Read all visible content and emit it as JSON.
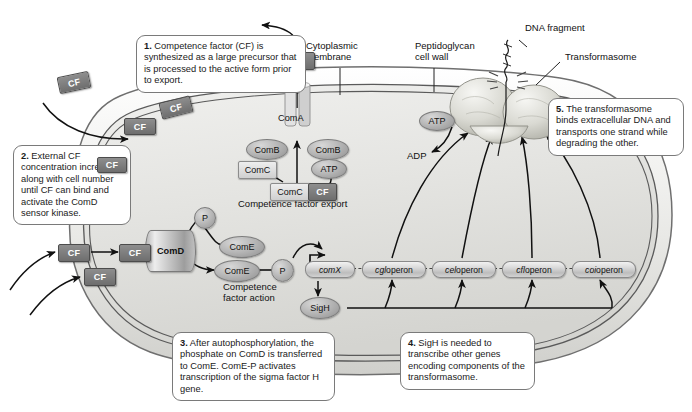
{
  "figure": {
    "type": "biological-pathway-diagram"
  },
  "callouts": [
    {
      "id": "step1",
      "number": "1.",
      "text": "Competence factor (CF) is synthesized as a large precursor that is processed to the active form prior to export."
    },
    {
      "id": "step2",
      "number": "2.",
      "text": "External CF concentration increases along with cell number until CF can bind and activate the ComD sensor kinase."
    },
    {
      "id": "step3",
      "number": "3.",
      "text": "After autophosphorylation, the phosphate on ComD is transferred to ComE. ComE-P activates transcription of the sigma factor H gene."
    },
    {
      "id": "step4",
      "number": "4.",
      "text": "SigH is needed to transcribe other genes encoding components of the transformasome."
    },
    {
      "id": "step5",
      "number": "5.",
      "text": "The transformasome binds extracellular DNA and transports one strand while degrading the other."
    }
  ],
  "structure_labels": {
    "cytoplasmic_membrane": "Cytoplasmic\nmembrane",
    "cytoplasmic_membrane_l1": "Cytoplasmic",
    "cytoplasmic_membrane_l2": "membrane",
    "peptidoglycan_l1": "Peptidoglycan",
    "peptidoglycan_l2": "cell wall",
    "dna_fragment": "DNA fragment",
    "transformasome": "Transformasome"
  },
  "process_labels": {
    "competence_factor_export": "Competence factor export",
    "competence_factor_action_l1": "Competence",
    "competence_factor_action_l2": "factor action"
  },
  "molecules": {
    "cf": "CF",
    "coma": "ComA",
    "comb": "ComB",
    "comc": "ComC",
    "comd": "ComD",
    "come": "ComE",
    "atp": "ATP",
    "adp": "ADP",
    "phosphate": "P",
    "sigh": "SigH"
  },
  "cf_instances": [
    {
      "id": "cf-extracellular-top",
      "label": "CF",
      "variant": "dark"
    },
    {
      "id": "cf-precursor-diagonal",
      "label": "CF",
      "variant": "dark"
    },
    {
      "id": "cf-exported-left",
      "label": "CF",
      "variant": "dark"
    },
    {
      "id": "cf-above-pore",
      "label": "CF",
      "variant": "dark"
    },
    {
      "id": "cf-binding-left",
      "label": "CF",
      "variant": "dark"
    },
    {
      "id": "cf-bound-comd",
      "label": "CF",
      "variant": "dark"
    },
    {
      "id": "cf-free-lower-left",
      "label": "CF",
      "variant": "dark"
    },
    {
      "id": "cf-in-box2",
      "label": "CF",
      "variant": "dark"
    },
    {
      "id": "cf-comc-complex",
      "label": "CF",
      "variant": "dark"
    }
  ],
  "operons": [
    {
      "id": "comx",
      "italic": "comX",
      "roman": ""
    },
    {
      "id": "cgl",
      "italic": "cgl",
      "roman": " operon"
    },
    {
      "id": "cel",
      "italic": "cel",
      "roman": " operon"
    },
    {
      "id": "cfl",
      "italic": "cfl",
      "roman": " operon"
    },
    {
      "id": "coi",
      "italic": "coi",
      "roman": " operon"
    }
  ],
  "colors": {
    "page_background": "#ffffff",
    "cell_cytoplasm": "#e6e6e4",
    "cell_outline": "#6f6f6f",
    "membrane_line": "#5a5a5a",
    "protein_gray": "#a6a6a6",
    "cf_dark": "#7a7a7a",
    "arrow_black": "#111111",
    "callout_border": "#7a7a7a"
  }
}
